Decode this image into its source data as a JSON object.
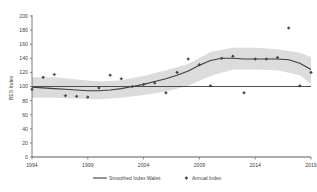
{
  "chart_data": {
    "type": "line",
    "title": "",
    "subtitle": "",
    "xlabel": "",
    "ylabel": "BES Index",
    "xlim": [
      1994,
      2019
    ],
    "ylim": [
      0,
      200
    ],
    "grid": false,
    "legend_position": "bottom",
    "y_ticks": [
      0,
      20,
      40,
      60,
      80,
      100,
      120,
      140,
      160,
      180,
      200
    ],
    "y_tick_labels": [
      "0",
      "20",
      "40",
      "60",
      "80",
      "100",
      "120",
      "140",
      "160",
      "180",
      "200"
    ],
    "x_ticks": [
      1994,
      1999,
      2004,
      2009,
      2014,
      2019
    ],
    "x_tick_labels": [
      "1994",
      "1999",
      "2004",
      "2009",
      "2014",
      "2019"
    ],
    "reference_line": {
      "value": 100,
      "label": ""
    },
    "series": [
      {
        "name": "Smoothed Index Wales",
        "type": "line",
        "color": "#3d3d3d",
        "x": [
          1994,
          1995,
          1996,
          1997,
          1998,
          1999,
          2000,
          2001,
          2002,
          2003,
          2004,
          2005,
          2006,
          2007,
          2008,
          2009,
          2010,
          2011,
          2012,
          2013,
          2014,
          2015,
          2016,
          2017,
          2018,
          2019
        ],
        "values": [
          99,
          98,
          97,
          96,
          95,
          94,
          94,
          95,
          97,
          100,
          103,
          107,
          111,
          116,
          122,
          130,
          137,
          140,
          140,
          139,
          139,
          139,
          139,
          138,
          133,
          124
        ]
      },
      {
        "name": "Annual Index",
        "type": "scatter",
        "color": "#3d3d3d",
        "x": [
          1994,
          1995,
          1996,
          1997,
          1998,
          1999,
          2000,
          2001,
          2002,
          2003,
          2004,
          2005,
          2006,
          2007,
          2008,
          2009,
          2010,
          2011,
          2012,
          2013,
          2014,
          2015,
          2016,
          2017,
          2018,
          2019
        ],
        "values": [
          96,
          113,
          117,
          87,
          86,
          85,
          98,
          116,
          111,
          100,
          103,
          105,
          91,
          120,
          139,
          131,
          101,
          140,
          143,
          91,
          139,
          139,
          141,
          183,
          101,
          120
        ]
      },
      {
        "name": "Confidence band",
        "type": "area",
        "color": "#d9d9d9",
        "x": [
          1994,
          1996,
          1998,
          2000,
          2002,
          2004,
          2006,
          2008,
          2010,
          2012,
          2014,
          2016,
          2018,
          2019
        ],
        "lower": [
          84,
          84,
          83,
          82,
          84,
          88,
          93,
          101,
          115,
          124,
          124,
          123,
          116,
          104
        ],
        "upper": [
          113,
          113,
          110,
          107,
          109,
          115,
          123,
          132,
          149,
          155,
          155,
          153,
          148,
          142
        ]
      }
    ],
    "legend_entries": [
      {
        "label": "Smoothed Index Wales",
        "marker": "line",
        "color": "#3d3d3d"
      },
      {
        "label": "Annual Index",
        "marker": "diamond",
        "color": "#3d3d3d"
      }
    ]
  }
}
